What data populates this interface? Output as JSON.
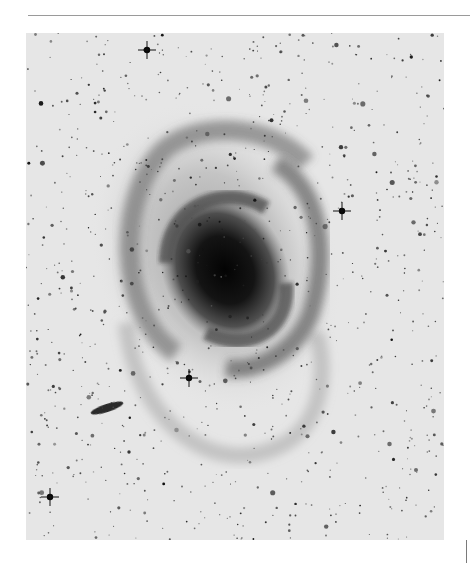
{
  "page": {
    "cut_off_header_text": "",
    "rule_color": "#9a9a9a",
    "background": "#ffffff"
  },
  "plate": {
    "subject": "spiral galaxy photographic plate (negative print)",
    "sky_color": "#e4e4e4",
    "core_color": "#050505",
    "arm_color": "#3a3a3a",
    "halo_color": "#b8b8b8",
    "features": [
      {
        "name": "galaxy-core",
        "x": 199,
        "y": 237
      },
      {
        "name": "bright-star-spiked",
        "x": 163,
        "y": 345
      },
      {
        "name": "bright-star-spiked",
        "x": 24,
        "y": 464
      },
      {
        "name": "bright-star-spiked",
        "x": 316,
        "y": 178
      },
      {
        "name": "bright-star-spiked",
        "x": 121,
        "y": 17
      },
      {
        "name": "companion-edge-on-galaxy",
        "x": 81,
        "y": 375
      }
    ]
  }
}
